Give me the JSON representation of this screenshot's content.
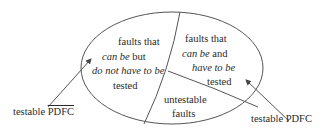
{
  "diagram": {
    "regions": {
      "left": {
        "line1": "faults that",
        "line2_italic": "can be",
        "line2_rest": "but",
        "line3_italic": "do not have to be",
        "line4": "tested"
      },
      "right": {
        "line1": "faults that",
        "line2_italic": "can be",
        "line2_rest": "and",
        "line3_italic": "have to be",
        "line4": "tested"
      },
      "bottom": {
        "line1": "untestable",
        "line2": "faults"
      }
    },
    "labels": {
      "left_prefix": "testable",
      "left_overlined": "PDFC",
      "right": "testable PDFC"
    }
  }
}
